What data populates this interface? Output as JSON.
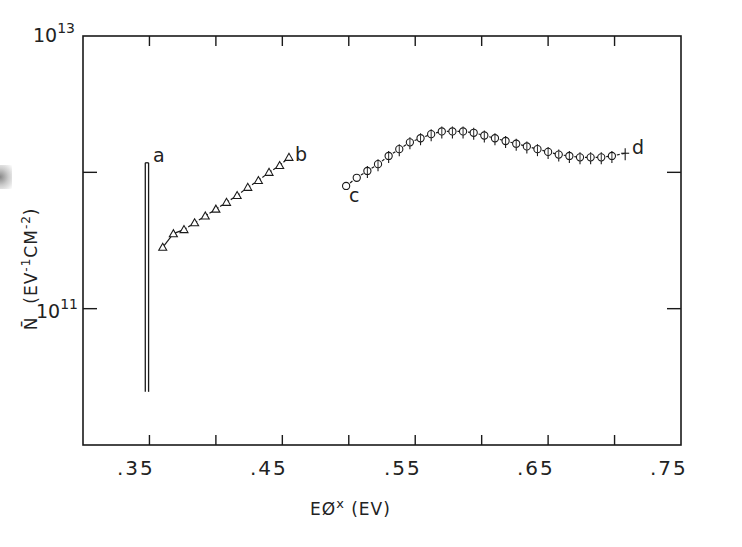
{
  "chart_data": {
    "type": "line",
    "title": "",
    "xlabel": "EØ× (EV)",
    "ylabel": "N̄ (EV⁻¹CM⁻²)",
    "xscale": "linear",
    "yscale": "log",
    "xlim": [
      0.3,
      0.75
    ],
    "ylim": [
      10000000000.0,
      10000000000000.0
    ],
    "x_tick_labels": [
      ".35",
      ".45",
      ".55",
      ".65",
      ".75"
    ],
    "x_tick_values": [
      0.35,
      0.4,
      0.45,
      0.5,
      0.55,
      0.6,
      0.65,
      0.7,
      0.75
    ],
    "y_tick_labels": [
      "10^13",
      "10^11"
    ],
    "y_tick_values": [
      10000000000000.0,
      1000000000000.0,
      100000000000.0
    ],
    "grid": false,
    "legend": "none (curves labeled inline a, b, c, d)",
    "series": [
      {
        "name": "a",
        "marker": "none (double vertical line)",
        "x": [
          0.348,
          0.348
        ],
        "log10_y": [
          10.39,
          12.07
        ],
        "y": [
          25000000000.0,
          1200000000000.0
        ]
      },
      {
        "name": "b",
        "marker": "triangle",
        "x": [
          0.36,
          0.368,
          0.376,
          0.384,
          0.392,
          0.4,
          0.408,
          0.416,
          0.424,
          0.432,
          0.44,
          0.448,
          0.455
        ],
        "log10_y": [
          11.45,
          11.55,
          11.58,
          11.63,
          11.68,
          11.73,
          11.78,
          11.83,
          11.89,
          11.94,
          12.0,
          12.05,
          12.11
        ],
        "y": [
          280000000000.0,
          350000000000.0,
          380000000000.0,
          430000000000.0,
          480000000000.0,
          540000000000.0,
          600000000000.0,
          680000000000.0,
          780000000000.0,
          870000000000.0,
          1000000000000.0,
          1120000000000.0,
          1290000000000.0
        ]
      },
      {
        "name": "c-d",
        "label_start": "c",
        "label_end": "d",
        "marker": "circle with error bar",
        "x": [
          0.498,
          0.506,
          0.514,
          0.522,
          0.53,
          0.538,
          0.546,
          0.554,
          0.562,
          0.57,
          0.578,
          0.586,
          0.594,
          0.602,
          0.61,
          0.618,
          0.626,
          0.634,
          0.642,
          0.65,
          0.658,
          0.666,
          0.674,
          0.682,
          0.69,
          0.698,
          0.708
        ],
        "log10_y": [
          11.9,
          11.96,
          12.01,
          12.06,
          12.12,
          12.17,
          12.22,
          12.25,
          12.28,
          12.3,
          12.3,
          12.3,
          12.29,
          12.27,
          12.25,
          12.23,
          12.21,
          12.19,
          12.17,
          12.15,
          12.13,
          12.12,
          12.11,
          12.11,
          12.11,
          12.12,
          12.14
        ],
        "y": [
          790000000000.0,
          910000000000.0,
          1020000000000.0,
          1150000000000.0,
          1320000000000.0,
          1480000000000.0,
          1660000000000.0,
          1780000000000.0,
          1910000000000.0,
          2000000000000.0,
          2000000000000.0,
          2000000000000.0,
          1950000000000.0,
          1860000000000.0,
          1780000000000.0,
          1700000000000.0,
          1620000000000.0,
          1550000000000.0,
          1480000000000.0,
          1410000000000.0,
          1350000000000.0,
          1320000000000.0,
          1290000000000.0,
          1290000000000.0,
          1290000000000.0,
          1320000000000.0,
          1380000000000.0
        ]
      }
    ],
    "annotations": [
      "a",
      "b",
      "c",
      "d"
    ]
  },
  "axes": {
    "x_ticks": [
      ".35",
      ".45",
      ".55",
      ".65",
      ".75"
    ],
    "y_tick_top": {
      "base": "10",
      "exp": "13"
    },
    "y_tick_mid": {
      "base": "10",
      "exp": "11"
    },
    "xlabel_main": "EØ",
    "xlabel_sup": "x",
    "xlabel_unit": "(EV)",
    "ylabel_sym": "N̄",
    "ylabel_unit_a": "(EV",
    "ylabel_sup1": "-1",
    "ylabel_unit_b": "CM",
    "ylabel_sup2": "-2",
    "ylabel_close": ")"
  },
  "labels": {
    "a": "a",
    "b": "b",
    "c": "c",
    "d": "d"
  },
  "colors": {
    "ink": "#1a1a1a",
    "background": "#ffffff"
  }
}
